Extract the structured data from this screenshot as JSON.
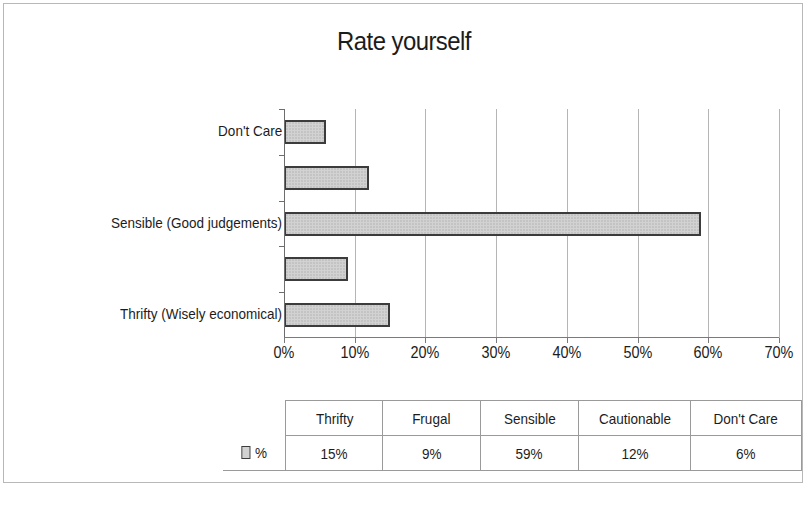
{
  "chart_data": {
    "type": "bar",
    "orientation": "horizontal",
    "title": "Rate yourself",
    "xlabel": "",
    "ylabel": "",
    "categories": [
      "Thrifty (Wisely economical)",
      "Frugal",
      "Sensible (Good judgements)",
      "Cautionable",
      "Don't Care"
    ],
    "values": [
      15,
      9,
      59,
      12,
      6
    ],
    "value_suffix": "%",
    "xlim": [
      0,
      70
    ],
    "xticks": [
      0,
      10,
      20,
      30,
      40,
      50,
      60,
      70
    ],
    "xtick_labels": [
      "0%",
      "10%",
      "20%",
      "30%",
      "40%",
      "50%",
      "60%",
      "70%"
    ],
    "visible_category_labels": [
      "Thrifty (Wisely economical)",
      "",
      "Sensible (Good judgements)",
      "",
      "Don't Care"
    ],
    "grid": true,
    "grid_axis": "x",
    "legend_position": "data-table",
    "series": [
      {
        "name": "%",
        "values": [
          15,
          9,
          59,
          12,
          6
        ],
        "fill_color": "#d2d2d2",
        "border_color": "#3c3c3c"
      }
    ]
  },
  "data_table": {
    "legend_label": "%",
    "columns": [
      "Thrifty",
      "Frugal",
      "Sensible",
      "Cautionable",
      "Don't Care"
    ],
    "rows": [
      {
        "series_label": "%",
        "cells": [
          "15%",
          "9%",
          "59%",
          "12%",
          "6%"
        ]
      }
    ]
  },
  "colors": {
    "bar_fill": "#d2d2d2",
    "bar_border": "#3c3c3c",
    "gridline": "#b5b5b5",
    "axis": "#6d6d6d",
    "frame_border": "#b8b8b8",
    "text": "#1c1c1c"
  }
}
